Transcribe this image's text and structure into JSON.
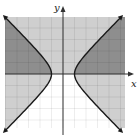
{
  "chart_data": {
    "type": "area",
    "title": "",
    "xlabel": "x",
    "ylabel": "y",
    "xlim": [
      -5,
      5
    ],
    "ylim": [
      -4.5,
      4.5
    ],
    "grid": true,
    "curves": [
      {
        "name": "hyperbola",
        "equation": "x^2 - y^2 = 1",
        "vertices": [
          [
            -1,
            0
          ],
          [
            1,
            0
          ]
        ],
        "style": "solid",
        "arrows": true
      }
    ],
    "regions": [
      {
        "name": "upper-half",
        "inequality": "y >= 0",
        "fill": "#cfcfcf"
      },
      {
        "name": "outside-hyperbola",
        "inequality": "x^2 - y^2 >= 1",
        "fill": "#cfcfcf"
      },
      {
        "name": "overlap",
        "inequality": "y >= 0 and x^2 - y^2 >= 1",
        "fill": "#8e8e8e"
      }
    ]
  },
  "labels": {
    "x_axis": "x",
    "y_axis": "y"
  },
  "colors": {
    "light_shade": "#cfcfcf",
    "dark_shade": "#8e8e8e",
    "grid": "#d9d9d9",
    "curve": "#1a1a1a",
    "axis": "#333333"
  }
}
